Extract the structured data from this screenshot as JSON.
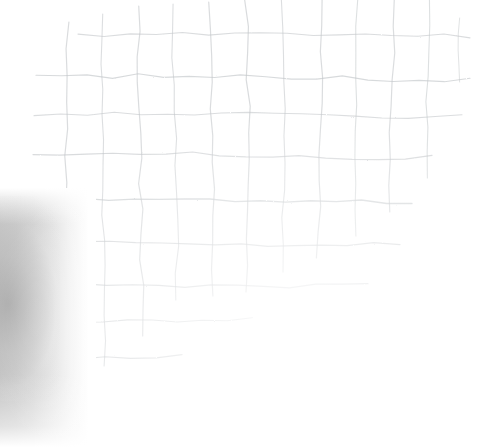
{
  "image": {
    "title": "Hand-drawn pencil grid on white paper",
    "medium": "scanned-paper",
    "width": 500,
    "height": 447,
    "background_color": "#ffffff",
    "line_color": "#c3c7ca",
    "line_color_light": "#d6d9db",
    "shadow_color": "#bfbfbf"
  },
  "grid": {
    "description": "Faint hand-ruled grid, lines irregular and wavering; staircase boundary where strokes terminate toward lower-right",
    "cell_width_avg": 36,
    "cell_height_avg": 40,
    "horizontal_lines": [
      {
        "name": "h-1",
        "y": 35,
        "x_start": 78,
        "x_end": 470,
        "width": 1.1,
        "opacity": 0.62,
        "wave": 4
      },
      {
        "name": "h-2",
        "y": 78,
        "x_start": 36,
        "x_end": 470,
        "width": 1.2,
        "opacity": 0.66,
        "wave": 5
      },
      {
        "name": "h-3",
        "y": 115,
        "x_start": 34,
        "x_end": 462,
        "width": 1.1,
        "opacity": 0.6,
        "wave": 4
      },
      {
        "name": "h-4",
        "y": 155,
        "x_start": 33,
        "x_end": 432,
        "width": 1.2,
        "opacity": 0.64,
        "wave": 5
      },
      {
        "name": "h-5",
        "y": 200,
        "x_start": 33,
        "x_end": 412,
        "width": 1.3,
        "opacity": 0.68,
        "wave": 5
      },
      {
        "name": "h-6",
        "y": 243,
        "x_start": 30,
        "x_end": 400,
        "width": 1.2,
        "opacity": 0.64,
        "wave": 4
      },
      {
        "name": "h-7",
        "y": 285,
        "x_start": 28,
        "x_end": 368,
        "width": 1.2,
        "opacity": 0.62,
        "wave": 4
      },
      {
        "name": "h-8",
        "y": 320,
        "x_start": 28,
        "x_end": 252,
        "width": 1.1,
        "opacity": 0.58,
        "wave": 3
      },
      {
        "name": "h-9",
        "y": 357,
        "x_start": 28,
        "x_end": 182,
        "width": 1.2,
        "opacity": 0.6,
        "wave": 3
      },
      {
        "name": "h-10",
        "y": 432,
        "x_start": 27,
        "x_end": 60,
        "width": 1.1,
        "opacity": 0.55,
        "wave": 2
      }
    ],
    "vertical_lines": [
      {
        "name": "v-1",
        "x": 32,
        "y_start": 203,
        "y_end": 444,
        "width": 1.2,
        "opacity": 0.6,
        "wave": 3
      },
      {
        "name": "v-2",
        "x": 68,
        "y_start": 22,
        "y_end": 370,
        "width": 1.2,
        "opacity": 0.62,
        "wave": 4
      },
      {
        "name": "v-3",
        "x": 103,
        "y_start": 14,
        "y_end": 366,
        "width": 1.1,
        "opacity": 0.58,
        "wave": 4
      },
      {
        "name": "v-4",
        "x": 140,
        "y_start": 6,
        "y_end": 336,
        "width": 1.2,
        "opacity": 0.62,
        "wave": 4
      },
      {
        "name": "v-5",
        "x": 175,
        "y_start": 4,
        "y_end": 300,
        "width": 1.1,
        "opacity": 0.58,
        "wave": 4
      },
      {
        "name": "v-6",
        "x": 211,
        "y_start": 2,
        "y_end": 296,
        "width": 1.2,
        "opacity": 0.62,
        "wave": 4
      },
      {
        "name": "v-7",
        "x": 247,
        "y_start": 0,
        "y_end": 292,
        "width": 1.2,
        "opacity": 0.64,
        "wave": 4
      },
      {
        "name": "v-8",
        "x": 283,
        "y_start": 0,
        "y_end": 272,
        "width": 1.1,
        "opacity": 0.58,
        "wave": 3
      },
      {
        "name": "v-9",
        "x": 320,
        "y_start": 0,
        "y_end": 258,
        "width": 1.2,
        "opacity": 0.62,
        "wave": 4
      },
      {
        "name": "v-10",
        "x": 356,
        "y_start": 0,
        "y_end": 236,
        "width": 1.1,
        "opacity": 0.56,
        "wave": 3
      },
      {
        "name": "v-11",
        "x": 392,
        "y_start": 0,
        "y_end": 212,
        "width": 1.2,
        "opacity": 0.6,
        "wave": 4
      },
      {
        "name": "v-12",
        "x": 428,
        "y_start": 0,
        "y_end": 178,
        "width": 1.1,
        "opacity": 0.56,
        "wave": 3
      },
      {
        "name": "v-13",
        "x": 459,
        "y_start": 18,
        "y_end": 82,
        "width": 1.0,
        "opacity": 0.5,
        "wave": 2
      }
    ]
  },
  "shadow": {
    "name": "left-edge-shadow",
    "x": 0,
    "y": 188,
    "width": 96,
    "height": 259,
    "peak_color": "#b8b8b8",
    "falloff": "horizontal gradient fading to white at ~x=90"
  }
}
